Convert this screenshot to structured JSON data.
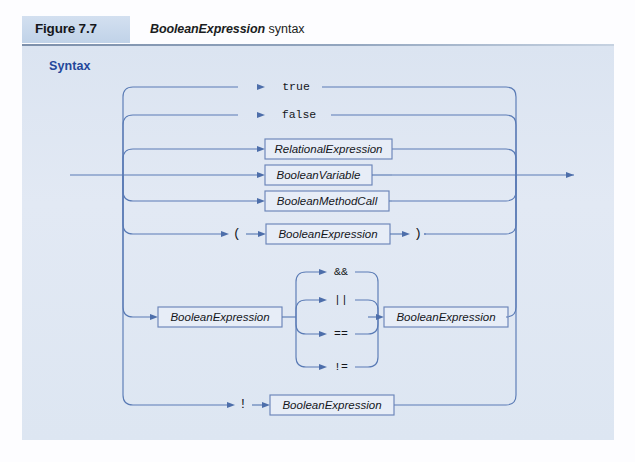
{
  "figure": {
    "label": "Figure 7.7",
    "caption_italic": "BooleanExpression",
    "caption_plain": " syntax",
    "section_heading": "Syntax"
  },
  "colors": {
    "panel_background": "#dde5f2",
    "rail_stroke": "#5a7bb5",
    "box_fill": "#e7edf7",
    "box_stroke": "#6b85b8",
    "heading_blue": "#23479b",
    "label_box_fill": "#c5d5ea"
  },
  "diagram": {
    "type": "railroad-syntax-diagram",
    "rule_name": "BooleanExpression",
    "entry_label": "entry",
    "exit_label": "exit",
    "alternatives": [
      {
        "id": "alt-true",
        "kind": "terminal",
        "items": [
          "true"
        ]
      },
      {
        "id": "alt-false",
        "kind": "terminal",
        "items": [
          "false"
        ]
      },
      {
        "id": "alt-relexpr",
        "kind": "nonterminal",
        "items": [
          "RelationalExpression"
        ]
      },
      {
        "id": "alt-boolvar",
        "kind": "nonterminal",
        "items": [
          "BooleanVariable"
        ]
      },
      {
        "id": "alt-boolcall",
        "kind": "nonterminal",
        "items": [
          "BooleanMethodCall"
        ]
      },
      {
        "id": "alt-paren",
        "kind": "mixed",
        "items": [
          "(",
          "BooleanExpression",
          ")"
        ]
      },
      {
        "id": "alt-binary",
        "kind": "mixed",
        "items": [
          "BooleanExpression",
          "operator",
          "BooleanExpression"
        ]
      },
      {
        "id": "alt-negation",
        "kind": "mixed",
        "items": [
          "!",
          "BooleanExpression"
        ]
      }
    ],
    "operators": [
      "&&",
      "||",
      "==",
      "!="
    ],
    "nodes": {
      "true": "true",
      "false": "false",
      "relational_expression": "RelationalExpression",
      "boolean_variable": "BooleanVariable",
      "boolean_method_call": "BooleanMethodCall",
      "boolean_expression": "BooleanExpression",
      "open_paren": "(",
      "close_paren": ")",
      "not_operator": "!",
      "op_and": "&&",
      "op_or": "||",
      "op_eq": "==",
      "op_neq": "!="
    }
  }
}
